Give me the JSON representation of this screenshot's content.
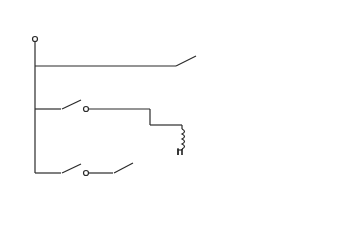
{
  "diagram": {
    "type": "relay control circuit schematic",
    "labels": {
      "power_source_line1": "Power",
      "power_source_line2": "source",
      "plus_v": "+V",
      "s1": "S1",
      "s1_desc": "Valve control switch",
      "s2": "S2",
      "s2_desc_line1": "Pump motor",
      "s2_desc_line2": "control switch",
      "relay_coil": "A",
      "relay": "Relay",
      "a1": "A1",
      "a1_nc": "N.C.",
      "a1_no": "N.O.",
      "a2": "A2",
      "a2_nc": "N.C.",
      "a2_no": "N.O.",
      "input_valve_line1": "Input",
      "input_valve_line2": "Valve",
      "pump_motor": "Pump motor",
      "ground_line1": "Power return",
      "ground_line2": "or",
      "ground_line3": "ground"
    },
    "components": [
      {
        "id": "S1",
        "kind": "switch",
        "description": "Valve control switch"
      },
      {
        "id": "S2",
        "kind": "switch",
        "description": "Pump motor control switch"
      },
      {
        "id": "A",
        "kind": "relay-coil",
        "description": "Relay"
      },
      {
        "id": "A1",
        "kind": "relay-contact",
        "contacts": [
          "N.C.",
          "N.O."
        ],
        "load": "Input Valve"
      },
      {
        "id": "A2",
        "kind": "relay-contact",
        "contacts": [
          "N.C.",
          "N.O."
        ],
        "load": "Pump motor"
      },
      {
        "id": "valve",
        "kind": "lamp/valve",
        "description": "Input Valve"
      },
      {
        "id": "motor",
        "kind": "motor",
        "description": "Pump motor"
      },
      {
        "id": "gnd",
        "kind": "ground",
        "description": "Power return or ground"
      }
    ]
  }
}
